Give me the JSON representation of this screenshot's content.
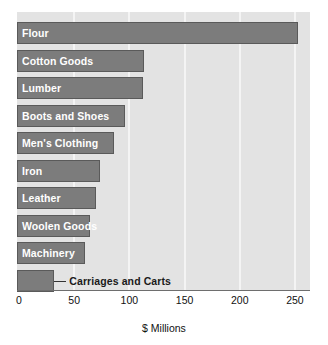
{
  "chart_data": {
    "type": "bar",
    "orientation": "horizontal",
    "title": "",
    "xlabel": "$ Millions",
    "ylabel": "",
    "xlim": [
      0,
      260
    ],
    "xticks": [
      0,
      50,
      100,
      150,
      200,
      250
    ],
    "xtick_labels": [
      "0",
      "50",
      "100",
      "150",
      "200",
      "250"
    ],
    "grid": "vertical-white-on-gray",
    "legend": "none",
    "categories": [
      "Flour",
      "Cotton Goods",
      "Lumber",
      "Boots and Shoes",
      "Men's Clothing",
      "Iron",
      "Leather",
      "Woolen Goods",
      "Machinery",
      "Carriages and Carts"
    ],
    "values": [
      253,
      113,
      112,
      96,
      86,
      73,
      70,
      64,
      60,
      32
    ],
    "bars": [
      {
        "label": "Flour",
        "value": 253,
        "label_position": "inside"
      },
      {
        "label": "Cotton Goods",
        "value": 113,
        "label_position": "inside"
      },
      {
        "label": "Lumber",
        "value": 112,
        "label_position": "inside"
      },
      {
        "label": "Boots and Shoes",
        "value": 96,
        "label_position": "inside"
      },
      {
        "label": "Men's Clothing",
        "value": 86,
        "label_position": "inside"
      },
      {
        "label": "Iron",
        "value": 73,
        "label_position": "inside"
      },
      {
        "label": "Leather",
        "value": 70,
        "label_position": "inside"
      },
      {
        "label": "Woolen Goods",
        "value": 64,
        "label_position": "inside"
      },
      {
        "label": "Machinery",
        "value": 60,
        "label_position": "inside"
      },
      {
        "label": "Carriages and Carts",
        "value": 32,
        "label_position": "callout"
      }
    ],
    "colors": {
      "bar_fill": "#7c7c7c",
      "bar_border": "#5a5a5a",
      "plot_background": "#e3e3e3",
      "gridline": "#f4f4f4",
      "inside_label_text": "#ffffff",
      "callout_label_text": "#1a1a1a",
      "axis": "#6e6e6e",
      "page_background": "#ffffff"
    }
  }
}
